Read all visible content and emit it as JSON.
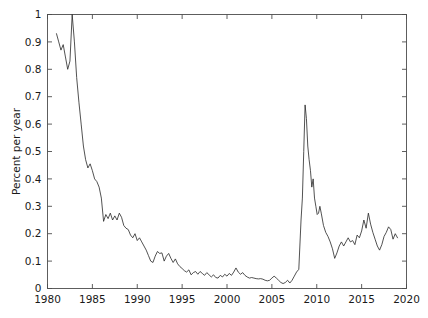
{
  "chart_data": {
    "type": "line",
    "title": "",
    "xlabel": "",
    "ylabel": "Percent per year",
    "xlim": [
      1980,
      2020
    ],
    "ylim": [
      0,
      1
    ],
    "xticks": [
      1980,
      1985,
      1990,
      1995,
      2000,
      2005,
      2010,
      2015,
      2020
    ],
    "xtick_labels": [
      "1980",
      "1985",
      "1990",
      "1995",
      "2000",
      "2005",
      "2010",
      "2015",
      "2020"
    ],
    "yticks": [
      0,
      0.1,
      0.2,
      0.3,
      0.4,
      0.5,
      0.6,
      0.7,
      0.8,
      0.9,
      1
    ],
    "ytick_labels": [
      "0",
      "0.1",
      "0.2",
      "0.3",
      "0.4",
      "0.5",
      "0.6",
      "0.7",
      "0.8",
      "0.9",
      "1"
    ],
    "grid": false,
    "legend": null,
    "line_color": "#262626",
    "line_width": 0.8,
    "box_color": "#4d4d4d",
    "background": "#ffffff",
    "series": [
      {
        "name": "Percent per year",
        "x": [
          1981.0,
          1981.25,
          1981.5,
          1981.75,
          1982.0,
          1982.25,
          1982.5,
          1982.75,
          1983.0,
          1983.25,
          1983.5,
          1983.75,
          1984.0,
          1984.25,
          1984.5,
          1984.75,
          1985.0,
          1985.25,
          1985.5,
          1985.75,
          1986.0,
          1986.25,
          1986.5,
          1986.75,
          1987.0,
          1987.25,
          1987.5,
          1987.75,
          1988.0,
          1988.25,
          1988.5,
          1988.75,
          1989.0,
          1989.25,
          1989.5,
          1989.75,
          1990.0,
          1990.25,
          1990.5,
          1990.75,
          1991.0,
          1991.25,
          1991.5,
          1991.75,
          1992.0,
          1992.25,
          1992.5,
          1992.75,
          1993.0,
          1993.25,
          1993.5,
          1993.75,
          1994.0,
          1994.25,
          1994.5,
          1994.75,
          1995.0,
          1995.25,
          1995.5,
          1995.75,
          1996.0,
          1996.25,
          1996.5,
          1996.75,
          1997.0,
          1997.25,
          1997.5,
          1997.75,
          1998.0,
          1998.25,
          1998.5,
          1998.75,
          1999.0,
          1999.25,
          1999.5,
          1999.75,
          2000.0,
          2000.25,
          2000.5,
          2000.75,
          2001.0,
          2001.25,
          2001.5,
          2001.75,
          2002.0,
          2002.25,
          2002.5,
          2002.75,
          2003.0,
          2003.25,
          2003.5,
          2003.75,
          2004.0,
          2004.25,
          2004.5,
          2004.75,
          2005.0,
          2005.25,
          2005.5,
          2005.75,
          2006.0,
          2006.25,
          2006.5,
          2006.75,
          2007.0,
          2007.25,
          2007.5,
          2007.75,
          2008.0,
          2008.25,
          2008.4,
          2008.55,
          2008.7,
          2008.85,
          2009.0,
          2009.15,
          2009.3,
          2009.45,
          2009.6,
          2009.75,
          2009.9,
          2010.05,
          2010.2,
          2010.35,
          2010.5,
          2010.75,
          2011.0,
          2011.25,
          2011.5,
          2011.75,
          2012.0,
          2012.25,
          2012.5,
          2012.75,
          2013.0,
          2013.25,
          2013.5,
          2013.75,
          2014.0,
          2014.25,
          2014.5,
          2014.75,
          2015.0,
          2015.25,
          2015.5,
          2015.75,
          2016.0,
          2016.25,
          2016.5,
          2016.75,
          2017.0,
          2017.25,
          2017.5,
          2017.75,
          2018.0,
          2018.25,
          2018.5,
          2018.75,
          2019.0
        ],
        "y": [
          0.93,
          0.9,
          0.87,
          0.89,
          0.845,
          0.8,
          0.83,
          1.0,
          0.9,
          0.77,
          0.68,
          0.6,
          0.52,
          0.47,
          0.44,
          0.455,
          0.43,
          0.4,
          0.39,
          0.37,
          0.33,
          0.245,
          0.27,
          0.255,
          0.275,
          0.25,
          0.265,
          0.25,
          0.275,
          0.26,
          0.23,
          0.22,
          0.215,
          0.195,
          0.185,
          0.2,
          0.175,
          0.185,
          0.17,
          0.155,
          0.14,
          0.12,
          0.1,
          0.095,
          0.118,
          0.135,
          0.128,
          0.13,
          0.1,
          0.118,
          0.128,
          0.11,
          0.095,
          0.108,
          0.09,
          0.08,
          0.073,
          0.065,
          0.06,
          0.068,
          0.05,
          0.058,
          0.062,
          0.052,
          0.062,
          0.055,
          0.048,
          0.058,
          0.05,
          0.042,
          0.05,
          0.04,
          0.038,
          0.048,
          0.042,
          0.052,
          0.045,
          0.055,
          0.048,
          0.06,
          0.075,
          0.06,
          0.052,
          0.058,
          0.048,
          0.042,
          0.038,
          0.04,
          0.038,
          0.036,
          0.035,
          0.036,
          0.034,
          0.03,
          0.028,
          0.03,
          0.038,
          0.045,
          0.038,
          0.03,
          0.022,
          0.018,
          0.022,
          0.03,
          0.02,
          0.03,
          0.045,
          0.06,
          0.07,
          0.25,
          0.33,
          0.5,
          0.67,
          0.62,
          0.52,
          0.47,
          0.43,
          0.37,
          0.4,
          0.33,
          0.3,
          0.27,
          0.275,
          0.3,
          0.275,
          0.23,
          0.205,
          0.19,
          0.17,
          0.145,
          0.11,
          0.13,
          0.155,
          0.17,
          0.155,
          0.17,
          0.185,
          0.17,
          0.175,
          0.16,
          0.195,
          0.185,
          0.21,
          0.25,
          0.22,
          0.275,
          0.235,
          0.205,
          0.18,
          0.155,
          0.14,
          0.16,
          0.19,
          0.205,
          0.225,
          0.215,
          0.18,
          0.2,
          0.185
        ]
      }
    ]
  }
}
